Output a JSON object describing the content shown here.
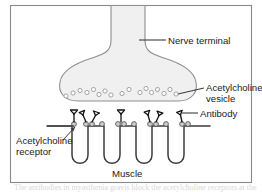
{
  "figure": {
    "border_color": "#8a8a8a",
    "background_color": "#ffffff"
  },
  "labels": {
    "nerve_terminal": "Nerve terminal",
    "acetylcholine_vesicle_line1": "Acetylcholine",
    "acetylcholine_vesicle_line2": "vesicle",
    "antibody": "Antibody",
    "acetylcholine_receptor_line1": "Acetylcholine",
    "acetylcholine_receptor_line2": "receptor",
    "muscle": "Muscle"
  },
  "structures": {
    "nerve_terminal": {
      "name": "nerve-terminal",
      "fill": "#f0f0f0",
      "stroke": "#8f8f8f"
    },
    "vesicles": {
      "name": "acetylcholine-vesicle",
      "count": 17,
      "fill": "#ffffff",
      "stroke": "#9a9a9a",
      "radius": 2.1,
      "positions": [
        [
          66,
          96
        ],
        [
          73,
          93
        ],
        [
          80,
          90
        ],
        [
          87,
          92
        ],
        [
          94,
          89
        ],
        [
          99,
          94
        ],
        [
          105,
          91
        ],
        [
          111,
          95
        ],
        [
          122,
          93
        ],
        [
          129,
          89
        ],
        [
          140,
          92
        ],
        [
          146,
          88
        ],
        [
          151,
          92
        ],
        [
          157,
          90
        ],
        [
          164,
          93
        ],
        [
          170,
          90
        ],
        [
          176,
          94
        ]
      ]
    },
    "muscle_membrane": {
      "name": "muscle-membrane",
      "stroke": "#3c3c3c",
      "fold_count": 4
    },
    "receptors": {
      "name": "acetylcholine-receptor",
      "count": 12,
      "fill": "#cfcfcf",
      "stroke": "#555555",
      "radius": 2.4
    },
    "antibodies": {
      "name": "antibody",
      "count": 7,
      "stroke": "#111111"
    }
  },
  "caption_cutoff": "The antibodies in myasthenia gravis block the acetylcholine receptors at the"
}
